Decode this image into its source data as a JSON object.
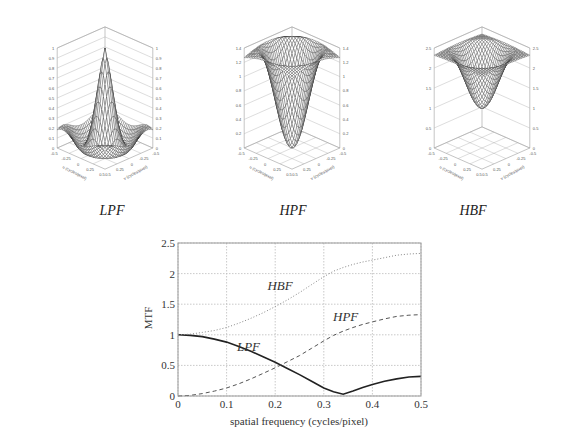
{
  "surfaces": [
    {
      "id": "lpf",
      "caption": "LPF",
      "zlabel": "MTF",
      "zticks": [
        "0",
        "0.1",
        "0.2",
        "0.3",
        "0.4",
        "0.5",
        "0.6",
        "0.7",
        "0.8",
        "0.9",
        "1"
      ],
      "zmax": 1,
      "uticks": [
        "-0.5",
        "-0.25",
        "0",
        "0.25",
        "0.5"
      ],
      "ulabel": "u (cycles/pixel)",
      "vlabel": "v (cycles/pixel)"
    },
    {
      "id": "hpf",
      "caption": "HPF",
      "zlabel": "MTF",
      "zticks": [
        "0",
        "0.2",
        "0.4",
        "0.6",
        "0.8",
        "1",
        "1.2",
        "1.4"
      ],
      "zmax": 1.4,
      "uticks": [
        "-0.5",
        "-0.25",
        "0",
        "0.25",
        "0.5"
      ],
      "ulabel": "u (cycles/pixel)",
      "vlabel": "v (cycles/pixel)"
    },
    {
      "id": "hbf",
      "caption": "HBF",
      "zlabel": "MTF",
      "zticks": [
        "0",
        "0.5",
        "1",
        "1.5",
        "2",
        "2.5"
      ],
      "zmax": 2.5,
      "uticks": [
        "-0.5",
        "-0.25",
        "0",
        "0.25",
        "0.5"
      ],
      "ulabel": "u (cycles/pixel)",
      "vlabel": "v (cycles/pixel)"
    }
  ],
  "chart_data": {
    "type": "line",
    "title": "",
    "xlabel": "spatial frequency (cycles/pixel)",
    "ylabel": "MTF",
    "xlim": [
      0,
      0.5
    ],
    "ylim": [
      0,
      2.5
    ],
    "xticks": [
      "0",
      "0.1",
      "0.2",
      "0.3",
      "0.4",
      "0.5"
    ],
    "yticks": [
      "0",
      "0.5",
      "1",
      "1.5",
      "2",
      "2.5"
    ],
    "grid": true,
    "x": [
      0,
      0.025,
      0.05,
      0.075,
      0.1,
      0.125,
      0.15,
      0.175,
      0.2,
      0.225,
      0.25,
      0.275,
      0.3,
      0.32,
      0.34,
      0.36,
      0.38,
      0.4,
      0.425,
      0.45,
      0.475,
      0.5
    ],
    "series": [
      {
        "name": "LPF",
        "style": "solid",
        "values": [
          1.0,
          0.99,
          0.97,
          0.93,
          0.88,
          0.81,
          0.73,
          0.64,
          0.55,
          0.45,
          0.35,
          0.24,
          0.13,
          0.07,
          0.03,
          0.08,
          0.14,
          0.19,
          0.24,
          0.28,
          0.31,
          0.32
        ]
      },
      {
        "name": "HPF",
        "style": "dashed",
        "values": [
          0.0,
          0.01,
          0.04,
          0.08,
          0.13,
          0.2,
          0.28,
          0.37,
          0.46,
          0.56,
          0.66,
          0.78,
          0.9,
          0.99,
          1.06,
          1.12,
          1.17,
          1.21,
          1.26,
          1.3,
          1.32,
          1.33
        ]
      },
      {
        "name": "HBF",
        "style": "dotted",
        "values": [
          1.0,
          1.01,
          1.04,
          1.07,
          1.12,
          1.19,
          1.27,
          1.36,
          1.46,
          1.57,
          1.69,
          1.82,
          1.95,
          2.04,
          2.1,
          2.15,
          2.19,
          2.22,
          2.26,
          2.3,
          2.32,
          2.33
        ]
      }
    ],
    "annotations": [
      {
        "text": "HBF",
        "x": 0.21,
        "y": 1.73
      },
      {
        "text": "HPF",
        "x": 0.345,
        "y": 1.23
      },
      {
        "text": "LPF",
        "x": 0.145,
        "y": 0.73
      }
    ]
  }
}
